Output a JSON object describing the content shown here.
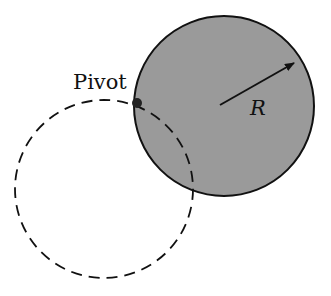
{
  "diagram": {
    "pivot_label": "Pivot",
    "radius_label": "R",
    "colors": {
      "disk_fill": "#9a9a9a",
      "stroke": "#111111",
      "background": "#ffffff"
    },
    "shapes": {
      "solid_disk": {
        "cx": 224,
        "cy": 106,
        "r": 90
      },
      "dashed_circle": {
        "cx": 104,
        "cy": 189,
        "r": 89
      },
      "pivot_point": {
        "cx": 137,
        "cy": 103,
        "r": 5
      },
      "radius_arrow": {
        "x1": 220,
        "y1": 105,
        "x2": 296,
        "y2": 62
      }
    }
  }
}
